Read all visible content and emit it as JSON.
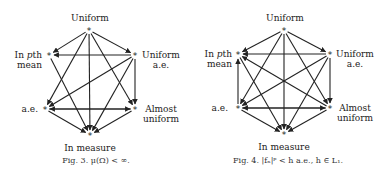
{
  "figures": [
    {
      "caption": "Fig. 3.  μ(Ω) < ∞.",
      "nodes": {
        "uniform": {
          "label": "Uniform",
          "x": 89,
          "y": 30
        },
        "pth_mean": {
          "label1": "In ",
          "label_italic": "p",
          "label2": "th",
          "label3": "mean",
          "x": 49,
          "y": 55
        },
        "uniform_ae": {
          "label1": "Uniform",
          "label2": "a.e.",
          "x": 135,
          "y": 55
        },
        "ae": {
          "label": "a.e.",
          "x": 45,
          "y": 109
        },
        "almost_uniform": {
          "label1": "Almost",
          "label2": "uniform",
          "x": 135,
          "y": 109
        },
        "in_measure": {
          "label": "In measure",
          "x": 90,
          "y": 135
        }
      },
      "edges": [
        [
          "uniform",
          "pth_mean"
        ],
        [
          "uniform",
          "uniform_ae"
        ],
        [
          "uniform",
          "ae"
        ],
        [
          "uniform",
          "almost_uniform"
        ],
        [
          "uniform",
          "in_measure"
        ],
        [
          "uniform_ae",
          "pth_mean"
        ],
        [
          "uniform_ae",
          "ae"
        ],
        [
          "uniform_ae",
          "almost_uniform"
        ],
        [
          "uniform_ae",
          "in_measure"
        ],
        [
          "pth_mean",
          "in_measure"
        ],
        [
          "ae",
          "almost_uniform"
        ],
        [
          "almost_uniform",
          "ae"
        ],
        [
          "ae",
          "in_measure"
        ],
        [
          "almost_uniform",
          "in_measure"
        ]
      ]
    },
    {
      "caption": "Fig. 4.  |fₙ|ᵖ < h a.e., h ∈ L₁.",
      "nodes": {
        "uniform": {
          "label": "Uniform",
          "x": 92,
          "y": 30
        },
        "pth_mean": {
          "label1": "In ",
          "label_italic": "p",
          "label2": "th",
          "label3": "mean",
          "x": 46,
          "y": 54
        },
        "uniform_ae": {
          "label1": "Uniform",
          "label2": "a.e.",
          "x": 138,
          "y": 54
        },
        "ae": {
          "label": "a.e.",
          "x": 46,
          "y": 108
        },
        "almost_uniform": {
          "label1": "Almost",
          "label2": "uniform",
          "x": 138,
          "y": 108
        },
        "in_measure": {
          "label": "In measure",
          "x": 92,
          "y": 134
        }
      },
      "edges": [
        [
          "uniform",
          "pth_mean"
        ],
        [
          "uniform",
          "uniform_ae"
        ],
        [
          "uniform",
          "ae"
        ],
        [
          "uniform",
          "almost_uniform"
        ],
        [
          "uniform",
          "in_measure"
        ],
        [
          "uniform_ae",
          "pth_mean"
        ],
        [
          "uniform_ae",
          "ae"
        ],
        [
          "uniform_ae",
          "almost_uniform"
        ],
        [
          "uniform_ae",
          "in_measure"
        ],
        [
          "pth_mean",
          "in_measure"
        ],
        [
          "ae",
          "pth_mean"
        ],
        [
          "almost_uniform",
          "pth_mean"
        ],
        [
          "ae",
          "almost_uniform"
        ],
        [
          "almost_uniform",
          "ae"
        ],
        [
          "ae",
          "in_measure"
        ],
        [
          "almost_uniform",
          "in_measure"
        ]
      ]
    }
  ]
}
